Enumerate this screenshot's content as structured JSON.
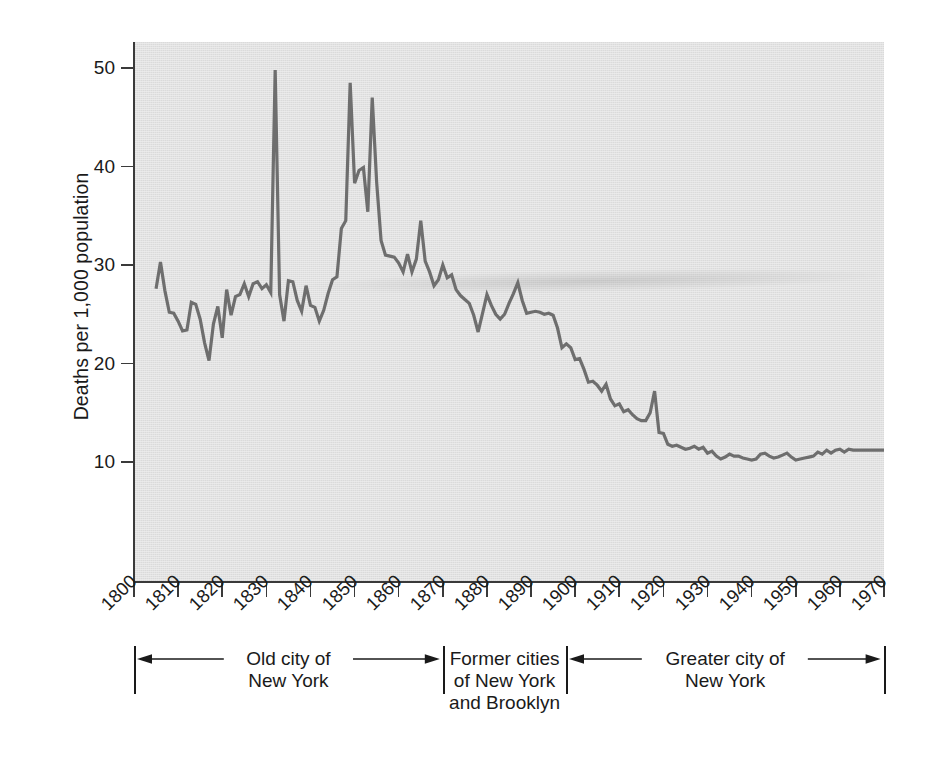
{
  "chart_data": {
    "type": "line",
    "title": "",
    "xlabel": "",
    "ylabel": "Deaths per 1,000 population",
    "xlim": [
      1800,
      1970
    ],
    "ylim": [
      0,
      54
    ],
    "grid": false,
    "legend": "none",
    "line_color": "#6e6e6e",
    "plot_background": "#e1e1e1",
    "axis_color": "#3a3a3a",
    "x_ticks": [
      1800,
      1810,
      1820,
      1830,
      1840,
      1850,
      1860,
      1870,
      1880,
      1890,
      1900,
      1910,
      1920,
      1930,
      1940,
      1950,
      1960,
      1970
    ],
    "y_ticks": [
      10,
      20,
      30,
      40,
      50
    ],
    "series_name": "Crude death rate, New York City",
    "x": [
      1805,
      1806,
      1807,
      1808,
      1809,
      1810,
      1811,
      1812,
      1813,
      1814,
      1815,
      1816,
      1817,
      1818,
      1819,
      1820,
      1821,
      1822,
      1823,
      1824,
      1825,
      1826,
      1827,
      1828,
      1829,
      1830,
      1831,
      1832,
      1833,
      1834,
      1835,
      1836,
      1837,
      1838,
      1839,
      1840,
      1841,
      1842,
      1843,
      1844,
      1845,
      1846,
      1847,
      1848,
      1849,
      1850,
      1851,
      1852,
      1853,
      1854,
      1855,
      1856,
      1857,
      1858,
      1859,
      1860,
      1861,
      1862,
      1863,
      1864,
      1865,
      1866,
      1867,
      1868,
      1869,
      1870,
      1871,
      1872,
      1873,
      1874,
      1875,
      1876,
      1877,
      1878,
      1879,
      1880,
      1881,
      1882,
      1883,
      1884,
      1885,
      1886,
      1887,
      1888,
      1889,
      1890,
      1891,
      1892,
      1893,
      1894,
      1895,
      1896,
      1897,
      1898,
      1899,
      1900,
      1901,
      1902,
      1903,
      1904,
      1905,
      1906,
      1907,
      1908,
      1909,
      1910,
      1911,
      1912,
      1913,
      1914,
      1915,
      1916,
      1917,
      1918,
      1919,
      1920,
      1921,
      1922,
      1923,
      1924,
      1925,
      1926,
      1927,
      1928,
      1929,
      1930,
      1931,
      1932,
      1933,
      1934,
      1935,
      1936,
      1937,
      1938,
      1939,
      1940,
      1941,
      1942,
      1943,
      1944,
      1945,
      1946,
      1947,
      1948,
      1949,
      1950,
      1951,
      1952,
      1953,
      1954,
      1955,
      1956,
      1957,
      1958,
      1959,
      1960,
      1961,
      1962,
      1963,
      1964,
      1965,
      1966,
      1967,
      1968,
      1969,
      1970
    ],
    "y": [
      27.6,
      30.3,
      27.4,
      25.2,
      25.1,
      24.3,
      23.3,
      23.4,
      26.2,
      26.0,
      24.5,
      22.1,
      20.3,
      24.0,
      25.8,
      22.6,
      27.5,
      24.9,
      26.8,
      27.0,
      28.1,
      26.8,
      28.1,
      28.3,
      27.6,
      28.0,
      27.2,
      49.8,
      27.0,
      24.3,
      28.4,
      28.3,
      26.4,
      25.3,
      27.9,
      25.9,
      25.7,
      24.3,
      25.4,
      27.1,
      28.5,
      28.8,
      33.7,
      34.5,
      48.5,
      38.3,
      39.6,
      39.9,
      35.4,
      47.0,
      38.4,
      32.5,
      31.0,
      30.9,
      30.8,
      30.2,
      29.3,
      31.1,
      29.3,
      30.6,
      34.5,
      30.4,
      29.3,
      27.9,
      28.5,
      30.0,
      28.7,
      29.0,
      27.5,
      26.9,
      26.5,
      26.1,
      24.9,
      23.2,
      25.1,
      27.0,
      25.9,
      25.0,
      24.5,
      25.0,
      26.1,
      27.1,
      28.2,
      26.4,
      25.1,
      25.2,
      25.3,
      25.2,
      25.0,
      25.1,
      24.9,
      23.6,
      21.6,
      22.0,
      21.6,
      20.4,
      20.5,
      19.4,
      18.1,
      18.2,
      17.8,
      17.2,
      17.9,
      16.4,
      15.7,
      15.9,
      15.1,
      15.3,
      14.8,
      14.4,
      14.2,
      14.2,
      15.0,
      17.2,
      13.0,
      12.9,
      11.8,
      11.6,
      11.7,
      11.5,
      11.3,
      11.4,
      11.6,
      11.3,
      11.5,
      10.9,
      11.1,
      10.6,
      10.3,
      10.5,
      10.8,
      10.6,
      10.6,
      10.4,
      10.3,
      10.2,
      10.3,
      10.8,
      10.9,
      10.6,
      10.4,
      10.5,
      10.7,
      10.9,
      10.5,
      10.2,
      10.3,
      10.4,
      10.5,
      10.6,
      11.0,
      10.8,
      11.2,
      10.9,
      11.2,
      11.3,
      11.0,
      11.3,
      11.2,
      11.2,
      11.2,
      11.2,
      11.2,
      11.2,
      11.2,
      11.2
    ]
  },
  "axis": {
    "y_title": "Deaths per 1,000 population",
    "y_tick_labels": [
      "10",
      "20",
      "30",
      "40",
      "50"
    ],
    "x_tick_labels": [
      "1800",
      "1810",
      "1820",
      "1830",
      "1840",
      "1850",
      "1860",
      "1870",
      "1880",
      "1890",
      "1900",
      "1910",
      "1920",
      "1930",
      "1940",
      "1950",
      "1960",
      "1970"
    ]
  },
  "eras": [
    {
      "id": "old-city",
      "label": "Old city of\nNew York",
      "start_year": 1800,
      "end_year": 1870,
      "arrows": "both"
    },
    {
      "id": "former-cities",
      "label": "Former cities\nof New York\nand Brooklyn",
      "start_year": 1870,
      "end_year": 1898,
      "arrows": "none"
    },
    {
      "id": "greater-city",
      "label": "Greater city of\nNew York",
      "start_year": 1898,
      "end_year": 1970,
      "arrows": "both"
    }
  ]
}
